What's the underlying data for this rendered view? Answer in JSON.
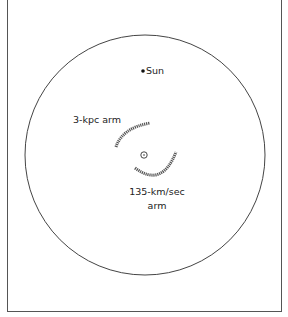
{
  "diagram": {
    "galaxy_circle": {
      "cx": 145,
      "cy": 155,
      "r": 120
    },
    "sun": {
      "label": "Sun",
      "x": 143,
      "y": 71
    },
    "center": {
      "x": 144,
      "y": 155
    },
    "arms": [
      {
        "label": "3-kpc arm"
      },
      {
        "label_line1": "135-km/sec",
        "label_line2": "arm"
      }
    ]
  },
  "colors": {
    "ink": "#333333",
    "frame": "#555555",
    "background": "#ffffff"
  }
}
